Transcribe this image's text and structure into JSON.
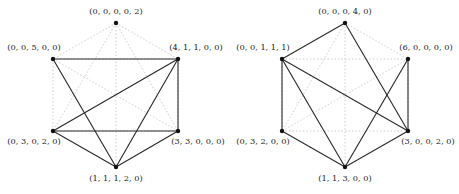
{
  "graphs": [
    {
      "id": "left",
      "nodes": [
        {
          "key": "top",
          "label": "(0, 0, 0, 0, 2)",
          "x": 116,
          "y": 23,
          "lx": 116,
          "ly": 14,
          "anchor": "middle"
        },
        {
          "key": "ul",
          "label": "(0, 0, 5, 0, 0)",
          "x": 53,
          "y": 59,
          "lx": 34,
          "ly": 50,
          "anchor": "middle"
        },
        {
          "key": "ur",
          "label": "(4, 1, 1, 0, 0)",
          "x": 178,
          "y": 59,
          "lx": 196,
          "ly": 50,
          "anchor": "middle"
        },
        {
          "key": "ll",
          "label": "(0, 3, 0, 2, 0)",
          "x": 53,
          "y": 131,
          "lx": 34,
          "ly": 144,
          "anchor": "middle"
        },
        {
          "key": "lr",
          "label": "(3, 3, 0, 0, 0)",
          "x": 178,
          "y": 131,
          "lx": 198,
          "ly": 144,
          "anchor": "middle"
        },
        {
          "key": "bottom",
          "label": "(1, 1, 1, 2, 0)",
          "x": 116,
          "y": 167,
          "lx": 116,
          "ly": 181,
          "anchor": "middle"
        }
      ],
      "solid_edges": [
        [
          "ul",
          "ur"
        ],
        [
          "ul",
          "bottom"
        ],
        [
          "ur",
          "ll"
        ],
        [
          "ur",
          "bottom"
        ],
        [
          "ur",
          "lr"
        ],
        [
          "ll",
          "lr"
        ],
        [
          "ll",
          "bottom"
        ],
        [
          "lr",
          "bottom"
        ]
      ]
    },
    {
      "id": "right",
      "nodes": [
        {
          "key": "top",
          "label": "(0, 0, 0, 4, 0)",
          "x": 345,
          "y": 23,
          "lx": 345,
          "ly": 14,
          "anchor": "middle"
        },
        {
          "key": "ul",
          "label": "(0, 0, 1, 1, 1)",
          "x": 282,
          "y": 59,
          "lx": 263,
          "ly": 50,
          "anchor": "middle"
        },
        {
          "key": "ur",
          "label": "(6, 0, 0, 0, 0)",
          "x": 408,
          "y": 59,
          "lx": 426,
          "ly": 50,
          "anchor": "middle"
        },
        {
          "key": "ll",
          "label": "(0, 3, 2, 0, 0)",
          "x": 282,
          "y": 131,
          "lx": 263,
          "ly": 144,
          "anchor": "middle"
        },
        {
          "key": "lr",
          "label": "(3, 0, 0, 2, 0)",
          "x": 408,
          "y": 131,
          "lx": 428,
          "ly": 144,
          "anchor": "middle"
        },
        {
          "key": "bottom",
          "label": "(1, 1, 3, 0, 0)",
          "x": 345,
          "y": 167,
          "lx": 345,
          "ly": 181,
          "anchor": "middle"
        }
      ],
      "solid_edges": [
        [
          "top",
          "ul"
        ],
        [
          "top",
          "lr"
        ],
        [
          "ul",
          "ll"
        ],
        [
          "ul",
          "bottom"
        ],
        [
          "ul",
          "lr"
        ],
        [
          "ur",
          "lr"
        ],
        [
          "ur",
          "bottom"
        ],
        [
          "ll",
          "bottom"
        ],
        [
          "lr",
          "bottom"
        ]
      ]
    }
  ],
  "background_graph": "complete-K6-dotted"
}
